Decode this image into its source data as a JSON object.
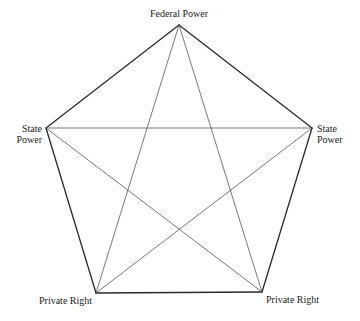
{
  "diagram": {
    "type": "pentagram-in-pentagon",
    "nodes": [
      {
        "id": "federal_power",
        "label": "Federal Power",
        "x": 179,
        "y": 25
      },
      {
        "id": "state_power_right",
        "label_line1": "State",
        "label_line2": "Power",
        "x": 312,
        "y": 128
      },
      {
        "id": "private_right_bottom_right",
        "label": "Private Right",
        "x": 262,
        "y": 292
      },
      {
        "id": "private_right_bottom_left",
        "label": "Private Right",
        "x": 96,
        "y": 293
      },
      {
        "id": "state_power_left",
        "label_line1": "State",
        "label_line2": "Power",
        "x": 46,
        "y": 128
      }
    ],
    "outer_edges": [
      [
        "federal_power",
        "state_power_right"
      ],
      [
        "state_power_right",
        "private_right_bottom_right"
      ],
      [
        "private_right_bottom_right",
        "private_right_bottom_left"
      ],
      [
        "private_right_bottom_left",
        "state_power_left"
      ],
      [
        "state_power_left",
        "federal_power"
      ]
    ],
    "inner_edges": [
      [
        "federal_power",
        "private_right_bottom_right"
      ],
      [
        "federal_power",
        "private_right_bottom_left"
      ],
      [
        "state_power_left",
        "state_power_right"
      ],
      [
        "state_power_left",
        "private_right_bottom_right"
      ],
      [
        "state_power_right",
        "private_right_bottom_left"
      ]
    ],
    "colors": {
      "outer_stroke": "#2a2a2a",
      "inner_stroke": "#555555",
      "background": "#ffffff"
    }
  },
  "labels": {
    "top": "Federal Power",
    "left_line1": "State",
    "left_line2": "Power",
    "right_line1": "State",
    "right_line2": "Power",
    "bottom_left": "Private Right",
    "bottom_right": "Private Right"
  }
}
